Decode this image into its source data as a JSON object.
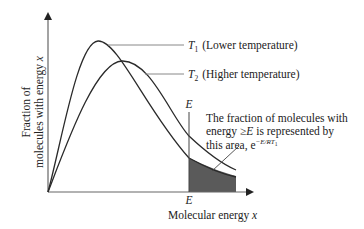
{
  "figure": {
    "y_axis_label_line1": "Fraction of",
    "y_axis_label_line2": "molecules with energy",
    "y_axis_var": "x",
    "x_axis_label": "Molecular energy",
    "x_axis_var": "x",
    "threshold_label_top": "E",
    "threshold_label_bottom": "E"
  },
  "legend": {
    "t1_symbol": "T",
    "t1_sub": "1",
    "t1_desc": "(Lower temperature)",
    "t2_symbol": "T",
    "t2_sub": "2",
    "t2_desc": "(Higher temperature)"
  },
  "annotation": {
    "line1": "The fraction of molecules with",
    "line2_pre": "energy ",
    "line2_geq": "≥",
    "line2_E": "E",
    "line2_post": " is represented by",
    "line3_pre": "this area, e",
    "line3_exp": "−E/RT",
    "line3_exp_sub": "1",
    "line3_post": ""
  },
  "colors": {
    "curve": "#2a2a2a",
    "axis": "#555555",
    "leader": "#777777",
    "shaded_area": "#5a5a5a"
  }
}
